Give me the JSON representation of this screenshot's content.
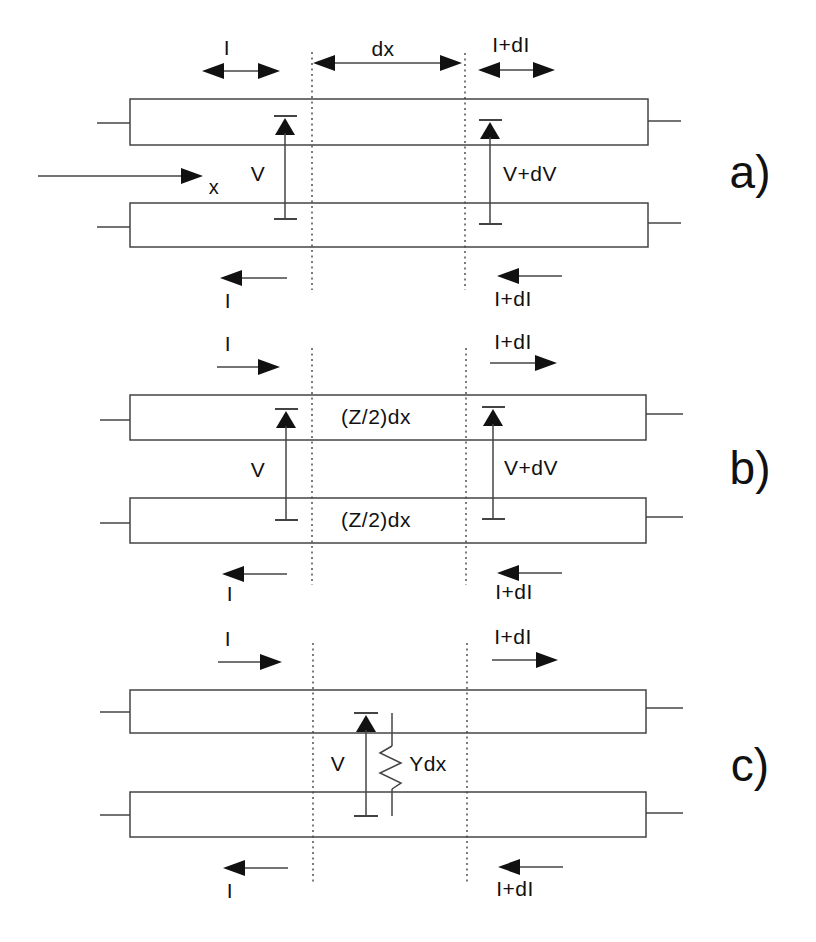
{
  "figure": {
    "colors": {
      "background": "#ffffff",
      "line": "#444444",
      "arrow": "#111111",
      "text": "#111111"
    },
    "sections": [
      {
        "id": "a",
        "caption": "a)",
        "top_left_current": "I",
        "segment_length": "dx",
        "top_right_current": "I+dI",
        "axis_label": "x",
        "left_voltage": "V",
        "right_voltage": "V+dV",
        "bottom_left_current": "I",
        "bottom_right_current": "I+dI"
      },
      {
        "id": "b",
        "caption": "b)",
        "top_left_current": "I",
        "top_right_current": "I+dI",
        "upper_impedance": "(Z/2)dx",
        "lower_impedance": "(Z/2)dx",
        "left_voltage": "V",
        "right_voltage": "V+dV",
        "bottom_left_current": "I",
        "bottom_right_current": "I+dI"
      },
      {
        "id": "c",
        "caption": "c)",
        "top_left_current": "I",
        "top_right_current": "I+dI",
        "voltage": "V",
        "admittance": "Ydx",
        "bottom_left_current": "I",
        "bottom_right_current": "I+dI"
      }
    ]
  }
}
